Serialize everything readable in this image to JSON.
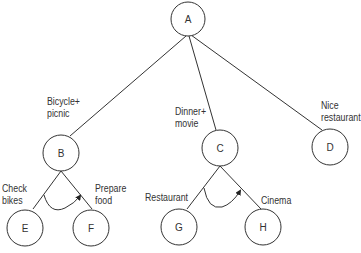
{
  "diagram": {
    "type": "goal-tree",
    "nodes": [
      {
        "id": "A",
        "label": "A"
      },
      {
        "id": "B",
        "label": "B",
        "caption": "Bicycle+\npicnic"
      },
      {
        "id": "C",
        "label": "C",
        "caption": "Dinner+\nmovie"
      },
      {
        "id": "D",
        "label": "D",
        "caption": "Nice\nrestaurant"
      },
      {
        "id": "E",
        "label": "E",
        "caption": "Check\nbikes"
      },
      {
        "id": "F",
        "label": "F",
        "caption": "Prepare\nfood"
      },
      {
        "id": "G",
        "label": "G",
        "caption": "Restaurant"
      },
      {
        "id": "H",
        "label": "H",
        "caption": "Cinema"
      }
    ],
    "edges": [
      [
        "A",
        "B"
      ],
      [
        "A",
        "C"
      ],
      [
        "A",
        "D"
      ],
      [
        "B",
        "E"
      ],
      [
        "B",
        "F"
      ],
      [
        "C",
        "G"
      ],
      [
        "C",
        "H"
      ]
    ],
    "and_arcs": [
      "B",
      "C"
    ],
    "colors": {
      "line": "#333333",
      "background": "#ffffff"
    }
  }
}
